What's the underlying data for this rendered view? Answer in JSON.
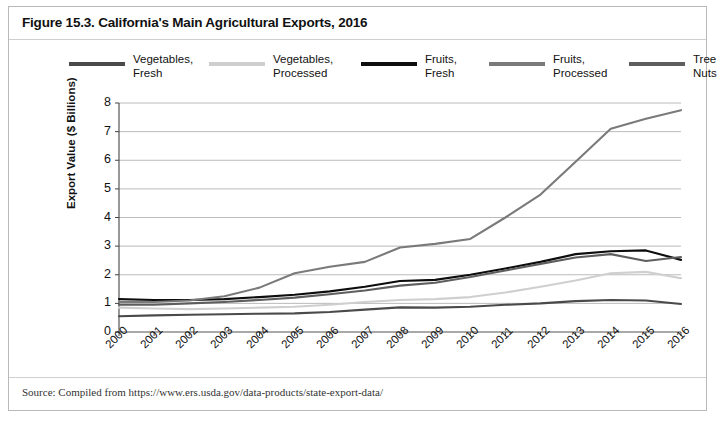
{
  "figure": {
    "title": "Figure 15.3. California's Main Agricultural Exports, 2016",
    "source": "Source: Compiled from https://www.ers.usda.gov/data-products/state-export-data/"
  },
  "legend": {
    "position": "top",
    "items": [
      {
        "label": "Vegetables,\nFresh",
        "color": "#4a4a4a"
      },
      {
        "label": "Vegetables,\nProcessed",
        "color": "#cfcfcf"
      },
      {
        "label": "Fruits,\nFresh",
        "color": "#0d0d0d"
      },
      {
        "label": "Fruits,\nProcessed",
        "color": "#7a7a7a"
      },
      {
        "label": "Tree\nNuts",
        "color": "#5e5e5e"
      }
    ]
  },
  "axes": {
    "ylabel": "Export Value ($ Billions)",
    "yticks": [
      "0",
      "1",
      "2",
      "3",
      "4",
      "5",
      "6",
      "7",
      "8"
    ],
    "xticks": [
      "2000",
      "2001",
      "2002",
      "2003",
      "2004",
      "2005",
      "2006",
      "2007",
      "2008",
      "2009",
      "2010",
      "2011",
      "2012",
      "2013",
      "2014",
      "2015",
      "2016"
    ]
  },
  "chart_data": {
    "type": "line",
    "title": "Figure 15.3. California's Main Agricultural Exports, 2016",
    "xlabel": "",
    "ylabel": "Export Value ($ Billions)",
    "ylim": [
      0,
      8
    ],
    "grid": true,
    "legend_position": "top",
    "categories": [
      "2000",
      "2001",
      "2002",
      "2003",
      "2004",
      "2005",
      "2006",
      "2007",
      "2008",
      "2009",
      "2010",
      "2011",
      "2012",
      "2013",
      "2014",
      "2015",
      "2016"
    ],
    "series": [
      {
        "name": "Vegetables, Fresh",
        "color": "#4a4a4a",
        "values": [
          0.55,
          0.58,
          0.6,
          0.62,
          0.64,
          0.65,
          0.7,
          0.78,
          0.86,
          0.85,
          0.88,
          0.95,
          1.0,
          1.08,
          1.12,
          1.1,
          0.98
        ]
      },
      {
        "name": "Vegetables, Processed",
        "color": "#cfcfcf",
        "values": [
          0.85,
          0.82,
          0.8,
          0.82,
          0.85,
          0.88,
          0.95,
          1.05,
          1.12,
          1.15,
          1.22,
          1.38,
          1.58,
          1.8,
          2.05,
          2.1,
          1.88
        ]
      },
      {
        "name": "Fruits, Fresh",
        "color": "#0d0d0d",
        "values": [
          1.15,
          1.12,
          1.12,
          1.15,
          1.22,
          1.3,
          1.42,
          1.58,
          1.78,
          1.82,
          2.0,
          2.22,
          2.45,
          2.72,
          2.82,
          2.85,
          2.52
        ]
      },
      {
        "name": "Fruits, Processed",
        "color": "#7a7a7a",
        "values": [
          1.05,
          1.05,
          1.1,
          1.25,
          1.55,
          2.05,
          2.28,
          2.45,
          2.95,
          3.08,
          3.25,
          4.0,
          4.8,
          5.95,
          7.1,
          7.45,
          7.75
        ]
      },
      {
        "name": "Tree Nuts",
        "color": "#5e5e5e",
        "values": [
          0.95,
          0.95,
          1.0,
          1.05,
          1.12,
          1.2,
          1.32,
          1.45,
          1.62,
          1.72,
          1.92,
          2.15,
          2.38,
          2.6,
          2.72,
          2.48,
          2.62
        ]
      }
    ],
    "notes": {
      "fruits_processed_peak_year": "2015",
      "fruits_processed_peak_value": 7.75,
      "fruits_processed_2016_value": 7.2
    }
  }
}
